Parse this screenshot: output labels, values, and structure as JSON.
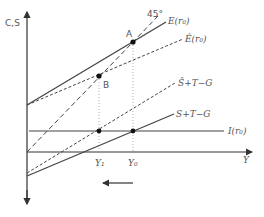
{
  "diagram": {
    "axes": {
      "y_label": "C,S",
      "x_label": "Y"
    },
    "curves": {
      "e_label": "E(r₀)",
      "e_hat_label": "Ê(r₀)",
      "s_hat_label": "Ŝ+T−G",
      "s_label": "S+T−G",
      "i_label": "I(r₀)",
      "line45_label": "45°"
    },
    "points": {
      "a_label": "A",
      "b_label": "B"
    },
    "x_ticks": {
      "y1_label": "Y₁",
      "y0_label": "Y₀"
    },
    "arrow": {
      "direction": "left"
    },
    "colors": {
      "line": "#444444",
      "label": "#555555",
      "guide": "#999999"
    }
  }
}
